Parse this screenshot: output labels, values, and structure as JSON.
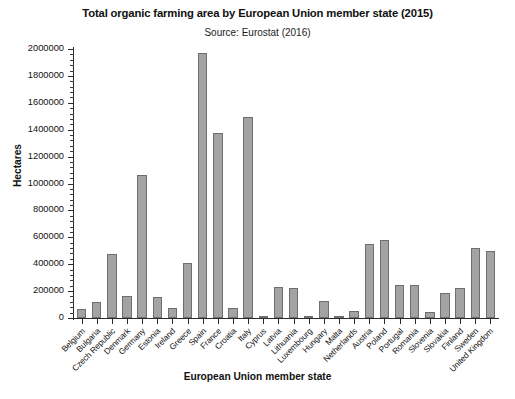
{
  "chart_data": {
    "type": "bar",
    "title": "Total organic farming area by European Union member state (2015)",
    "subtitle": "Source: Eurostat (2016)",
    "xlabel": "European Union member state",
    "ylabel": "Hectares",
    "ylim": [
      0,
      2000000
    ],
    "ytick_step": 200000,
    "minor_ticks": true,
    "grid": false,
    "legend": "none",
    "bar_color": "#a3a3a3",
    "bar_border_color": "#6e6e6e",
    "ytick_labels": [
      "0",
      "200000",
      "400000",
      "600000",
      "800000",
      "1000000",
      "1200000",
      "1400000",
      "1600000",
      "1800000",
      "2000000"
    ],
    "categories": [
      "Belgium",
      "Bulgaria",
      "Czech Republic",
      "Denmark",
      "Germany",
      "Estonia",
      "Ireland",
      "Greece",
      "Spain",
      "France",
      "Croatia",
      "Italy",
      "Cyprus",
      "Latvia",
      "Lithuania",
      "Luxembourg",
      "Hungary",
      "Malta",
      "Netherlands",
      "Austria",
      "Poland",
      "Portugal",
      "Romania",
      "Slovenia",
      "Slovakia",
      "Finland",
      "Sweden",
      "United Kingdom"
    ],
    "values": [
      68000,
      119000,
      478000,
      166000,
      1060000,
      156000,
      73000,
      408000,
      1968000,
      1375000,
      75000,
      1492000,
      5000,
      231000,
      221000,
      14000,
      130000,
      400,
      50000,
      553000,
      580000,
      245000,
      245000,
      42000,
      186000,
      225000,
      519000,
      495000
    ]
  }
}
